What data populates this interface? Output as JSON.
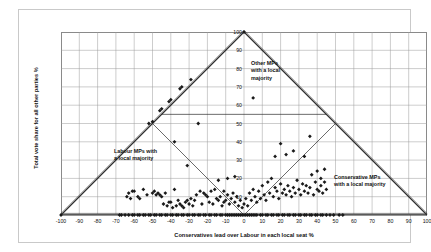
{
  "chart_data": {
    "type": "scatter",
    "title": "",
    "xlabel": "Conservatives lead over Labour in each local seat %",
    "ylabel": "Total vote share for all other parties %",
    "xlim": [
      -100,
      100
    ],
    "ylim": [
      0,
      100
    ],
    "xticks": [
      -100,
      -90,
      -80,
      -70,
      -60,
      -50,
      -40,
      -30,
      -20,
      -10,
      0,
      10,
      20,
      30,
      40,
      50,
      60,
      70,
      80,
      90,
      100
    ],
    "yticks": [
      0,
      10,
      20,
      30,
      40,
      50,
      60,
      70,
      80,
      90,
      100
    ],
    "grid": true,
    "legend": "none",
    "annotations": [
      {
        "name": "other-mps",
        "text": "Other MPs\nwith a local\nmajority",
        "x": 5,
        "y": 80
      },
      {
        "name": "labour-mps",
        "text": "Labour MPs with\na local majority",
        "x": -50,
        "y": 33
      },
      {
        "name": "conservative-mps",
        "text": "Conservative MPs\nwith a local majority",
        "x": 48,
        "y": 18
      }
    ],
    "reference_lines": [
      {
        "name": "outer-triangle-left",
        "from": [
          -100,
          0
        ],
        "to": [
          0,
          100
        ]
      },
      {
        "name": "outer-triangle-right",
        "from": [
          0,
          100
        ],
        "to": [
          100,
          0
        ]
      },
      {
        "name": "outer-triangle-base",
        "from": [
          -100,
          0
        ],
        "to": [
          100,
          0
        ]
      },
      {
        "name": "inner-v-left",
        "from": [
          -50,
          50
        ],
        "to": [
          0,
          0
        ]
      },
      {
        "name": "inner-v-right",
        "from": [
          0,
          0
        ],
        "to": [
          50,
          50
        ]
      },
      {
        "name": "horizontal-threshold",
        "from": [
          -45,
          55
        ],
        "to": [
          45,
          55
        ]
      }
    ],
    "series": [
      {
        "name": "UK local seats",
        "marker": "diamond",
        "color": "#1a1a1a",
        "points": [
          [
            -100,
            0
          ],
          [
            -68,
            0
          ],
          [
            -67,
            0
          ],
          [
            -65,
            0
          ],
          [
            -63,
            0
          ],
          [
            -61,
            0
          ],
          [
            -60,
            0
          ],
          [
            -58,
            0
          ],
          [
            -57,
            0
          ],
          [
            -55,
            0
          ],
          [
            -54,
            0
          ],
          [
            -52,
            0
          ],
          [
            -51,
            0
          ],
          [
            -49,
            0
          ],
          [
            -48,
            0
          ],
          [
            -46,
            0
          ],
          [
            -45,
            0
          ],
          [
            -43,
            0
          ],
          [
            -42,
            0
          ],
          [
            -40,
            0
          ],
          [
            -39,
            0
          ],
          [
            -37,
            0
          ],
          [
            -36,
            0
          ],
          [
            -34,
            0
          ],
          [
            -33,
            0
          ],
          [
            -31,
            0
          ],
          [
            -30,
            0
          ],
          [
            -28,
            0
          ],
          [
            -27,
            0
          ],
          [
            -25,
            0
          ],
          [
            -24,
            0
          ],
          [
            -22,
            0
          ],
          [
            -21,
            0
          ],
          [
            -19,
            0
          ],
          [
            -18,
            0
          ],
          [
            -16,
            0
          ],
          [
            -15,
            0
          ],
          [
            -13,
            0
          ],
          [
            -12,
            0
          ],
          [
            -10,
            0
          ],
          [
            -9,
            0
          ],
          [
            -8,
            0
          ],
          [
            -7,
            0
          ],
          [
            -6,
            0
          ],
          [
            -5,
            0
          ],
          [
            -4,
            0
          ],
          [
            -3,
            0
          ],
          [
            -2,
            0
          ],
          [
            -1,
            0
          ],
          [
            0,
            0
          ],
          [
            1,
            0
          ],
          [
            2,
            0
          ],
          [
            3,
            0
          ],
          [
            4,
            0
          ],
          [
            5,
            0
          ],
          [
            6,
            0
          ],
          [
            7,
            0
          ],
          [
            9,
            0
          ],
          [
            10,
            0
          ],
          [
            12,
            0
          ],
          [
            13,
            0
          ],
          [
            15,
            0
          ],
          [
            16,
            0
          ],
          [
            18,
            0
          ],
          [
            19,
            0
          ],
          [
            21,
            0
          ],
          [
            22,
            0
          ],
          [
            24,
            0
          ],
          [
            25,
            0
          ],
          [
            27,
            0
          ],
          [
            28,
            0
          ],
          [
            30,
            0
          ],
          [
            31,
            0
          ],
          [
            33,
            0
          ],
          [
            34,
            0
          ],
          [
            36,
            0
          ],
          [
            37,
            0
          ],
          [
            39,
            0
          ],
          [
            40,
            0
          ],
          [
            42,
            0
          ],
          [
            43,
            0
          ],
          [
            45,
            0
          ],
          [
            47,
            0
          ],
          [
            49,
            0
          ],
          [
            52,
            0
          ],
          [
            54,
            0
          ],
          [
            -62,
            9
          ],
          [
            -61,
            13
          ],
          [
            -58,
            10
          ],
          [
            -55,
            14
          ],
          [
            -47,
            12
          ],
          [
            -46,
            11
          ],
          [
            -45,
            10
          ],
          [
            -43,
            12
          ],
          [
            -40,
            7
          ],
          [
            -38,
            14
          ],
          [
            -37,
            5
          ],
          [
            -35,
            6
          ],
          [
            -33,
            4
          ],
          [
            -31,
            8
          ],
          [
            -28,
            5
          ],
          [
            -26,
            11
          ],
          [
            -24,
            13
          ],
          [
            -22,
            12
          ],
          [
            -21,
            11
          ],
          [
            -19,
            7
          ],
          [
            -18,
            13
          ],
          [
            -17,
            6
          ],
          [
            -16,
            14
          ],
          [
            -15,
            9
          ],
          [
            -13,
            10
          ],
          [
            -12,
            5
          ],
          [
            -11,
            13
          ],
          [
            -10,
            8
          ],
          [
            -9,
            11
          ],
          [
            -8,
            6
          ],
          [
            -7,
            9
          ],
          [
            -6,
            12
          ],
          [
            -5,
            7
          ],
          [
            -4,
            10
          ],
          [
            -3,
            5
          ],
          [
            -2,
            8
          ],
          [
            -1,
            4
          ],
          [
            0,
            6
          ],
          [
            1,
            9
          ],
          [
            2,
            5
          ],
          [
            3,
            12
          ],
          [
            4,
            8
          ],
          [
            5,
            14
          ],
          [
            6,
            10
          ],
          [
            7,
            7
          ],
          [
            8,
            13
          ],
          [
            9,
            9
          ],
          [
            10,
            16
          ],
          [
            11,
            11
          ],
          [
            12,
            8
          ],
          [
            13,
            18
          ],
          [
            14,
            12
          ],
          [
            15,
            20
          ],
          [
            16,
            10
          ],
          [
            17,
            15
          ],
          [
            18,
            13
          ],
          [
            19,
            9
          ],
          [
            20,
            17
          ],
          [
            21,
            12
          ],
          [
            22,
            14
          ],
          [
            23,
            11
          ],
          [
            24,
            16
          ],
          [
            25,
            13
          ],
          [
            26,
            10
          ],
          [
            27,
            15
          ],
          [
            28,
            12
          ],
          [
            29,
            19
          ],
          [
            30,
            14
          ],
          [
            31,
            11
          ],
          [
            32,
            17
          ],
          [
            33,
            13
          ],
          [
            34,
            16
          ],
          [
            35,
            12
          ],
          [
            36,
            15
          ],
          [
            37,
            22
          ],
          [
            38,
            11
          ],
          [
            39,
            18
          ],
          [
            40,
            14
          ],
          [
            41,
            13
          ],
          [
            42,
            16
          ],
          [
            43,
            12
          ],
          [
            44,
            25
          ],
          [
            45,
            14
          ],
          [
            -38,
            40
          ],
          [
            -31,
            27
          ],
          [
            -25,
            50
          ],
          [
            -14,
            19
          ],
          [
            -9,
            20
          ],
          [
            -5,
            21
          ],
          [
            17,
            32
          ],
          [
            20,
            39
          ],
          [
            23,
            33
          ],
          [
            27,
            35
          ],
          [
            33,
            32
          ],
          [
            36,
            43
          ],
          [
            40,
            24
          ],
          [
            42,
            20
          ],
          [
            -52,
            50
          ],
          [
            -50,
            51
          ],
          [
            -46,
            57
          ],
          [
            -45,
            58
          ],
          [
            -41,
            62
          ],
          [
            -40,
            63
          ],
          [
            -35,
            69
          ],
          [
            -34,
            70
          ],
          [
            -29,
            74
          ],
          [
            0,
            100
          ],
          [
            5,
            64
          ],
          [
            44,
            18
          ],
          [
            -64,
            10
          ],
          [
            -63,
            12
          ],
          [
            -60,
            13
          ],
          [
            -57,
            9
          ],
          [
            -53,
            11
          ],
          [
            -50,
            12
          ],
          [
            -49,
            13
          ],
          [
            -48,
            11
          ],
          [
            -44,
            6
          ],
          [
            -42,
            5
          ],
          [
            -41,
            7
          ],
          [
            -39,
            4
          ],
          [
            -36,
            8
          ],
          [
            -34,
            5
          ],
          [
            -32,
            7
          ],
          [
            -30,
            6
          ],
          [
            -29,
            9
          ],
          [
            -27,
            8
          ],
          [
            -23,
            6
          ],
          [
            -20,
            10
          ],
          [
            -14,
            8
          ],
          [
            -11,
            7
          ]
        ]
      }
    ]
  }
}
